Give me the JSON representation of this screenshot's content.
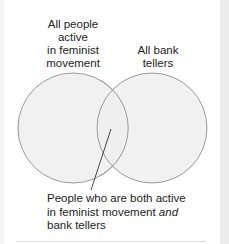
{
  "diagram": {
    "type": "venn",
    "sets": [
      {
        "label": "All people active in feminist movement",
        "lines": [
          "All people",
          "active",
          "in feminist",
          "movement"
        ]
      },
      {
        "label": "All bank tellers",
        "lines": [
          "All bank",
          "tellers"
        ]
      }
    ],
    "intersection": {
      "label_plain_1": "People who are both active",
      "label_plain_2": "in feminist movement ",
      "label_italic": "and",
      "label_plain_3": "bank tellers"
    },
    "colors": {
      "circle_fill": "#eeeeee",
      "circle_stroke": "#9a9a9a",
      "pointer_line": "#333333",
      "text": "#222222"
    }
  }
}
